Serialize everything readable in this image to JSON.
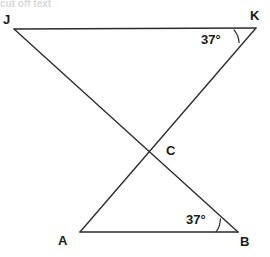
{
  "figure": {
    "type": "geometry-diagram",
    "width": 270,
    "height": 257,
    "background_color": "#ffffff",
    "stroke_color": "#2b2b2b",
    "text_color": "#1a1a1a",
    "top_artifact_text": "cut off text"
  },
  "points": [
    {
      "id": "J",
      "label": "J",
      "x": 14,
      "y": 29,
      "label_x": 3,
      "label_y": 13
    },
    {
      "id": "K",
      "label": "K",
      "x": 256,
      "y": 28,
      "label_x": 250,
      "label_y": 9
    },
    {
      "id": "A",
      "label": "A",
      "x": 80,
      "y": 232,
      "label_x": 58,
      "label_y": 234
    },
    {
      "id": "B",
      "label": "B",
      "x": 238,
      "y": 232,
      "label_x": 240,
      "label_y": 235
    },
    {
      "id": "C",
      "label": "C",
      "x": 148,
      "y": 152,
      "label_x": 166,
      "label_y": 144
    }
  ],
  "segments": [
    {
      "id": "JK",
      "from": "J",
      "to": "K",
      "description": "top horizontal side"
    },
    {
      "id": "AB",
      "from": "A",
      "to": "B",
      "description": "bottom horizontal side"
    },
    {
      "id": "JB",
      "from": "J",
      "to": "B",
      "description": "diagonal from J down to B through C"
    },
    {
      "id": "KA",
      "from": "K",
      "to": "A",
      "description": "diagonal from K down to A through C"
    }
  ],
  "angles": [
    {
      "id": "angle-K",
      "vertex": "K",
      "value": "37°",
      "label_x": 201,
      "label_y": 33,
      "arc_radius": 22,
      "between": [
        "KJ",
        "KA"
      ]
    },
    {
      "id": "angle-B",
      "vertex": "B",
      "value": "37°",
      "label_x": 186,
      "label_y": 213,
      "arc_radius": 22,
      "between": [
        "BA",
        "BJ"
      ]
    }
  ]
}
